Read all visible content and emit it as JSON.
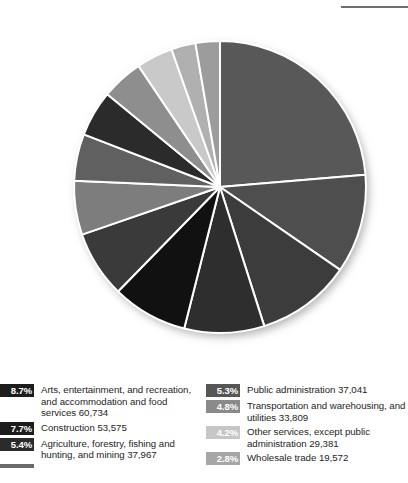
{
  "edge_caption": "es",
  "chart_data": {
    "type": "pie",
    "title": "",
    "subtitle": "",
    "xlabel": "",
    "ylabel": "",
    "legend_position": "bottom",
    "grid": false,
    "start_angle_deg": 0,
    "direction": "clockwise",
    "center": {
      "x": 220,
      "y": 187
    },
    "radius": 146,
    "separator_color": "#ffffff",
    "categories": [
      "Educational services, and health care and social assistance",
      "Manufacturing",
      "Retail trade",
      "Professional, scientific, and management, and administrative and waste management services",
      "Arts, entertainment, and recreation, and accommodation and food services",
      "Construction",
      "Finance and insurance, and real estate and rental and leasing",
      "Agriculture, forestry, fishing and hunting, and mining",
      "Public administration",
      "Transportation and warehousing, and utilities",
      "Other services, except public administration",
      "Information",
      "Wholesale trade"
    ],
    "values": [
      24.6,
      11.4,
      10.9,
      9.2,
      8.7,
      7.7,
      6.2,
      5.4,
      5.3,
      4.8,
      4.2,
      2.8,
      2.8
    ],
    "colors": [
      "#585858",
      "#4e4e4e",
      "#3c3c3c",
      "#2e2e2e",
      "#111111",
      "#3a3a3a",
      "#7d7d7d",
      "#606060",
      "#2b2b2b",
      "#8e8e8e",
      "#c9c9c9",
      "#b0b0b0",
      "#9c9c9c"
    ]
  },
  "legend": {
    "left_column": [
      {
        "percent": "8.7%",
        "label": "Arts, entertainment, and recreation, and accommodation and food services 60,734",
        "swatch_color": "#1c1c1c",
        "clipped": false
      },
      {
        "percent": "7.7%",
        "label": "Construction 53,575",
        "swatch_color": "#1c1c1c",
        "clipped": false
      },
      {
        "percent": "5.4%",
        "label": "Agriculture, forestry, fishing and hunting, and mining 37,967",
        "swatch_color": "#2b2b2b",
        "clipped": false
      },
      {
        "percent": "",
        "label": "",
        "swatch_color": "#6a6a6a",
        "clipped": true
      }
    ],
    "right_column": [
      {
        "percent": "5.3%",
        "label": "Public administration 37,041",
        "swatch_color": "#565656",
        "clipped": false
      },
      {
        "percent": "4.8%",
        "label": "Transportation and warehousing, and utilities 33,809",
        "swatch_color": "#8a8a8a",
        "clipped": false
      },
      {
        "percent": "4.2%",
        "label": "Other services, except public administration 29,381",
        "swatch_color": "#c6c6c6",
        "clipped": false
      },
      {
        "percent": "2.8%",
        "label": "Wholesale trade 19,572",
        "swatch_color": "#a6a6a6",
        "clipped": false
      }
    ]
  }
}
